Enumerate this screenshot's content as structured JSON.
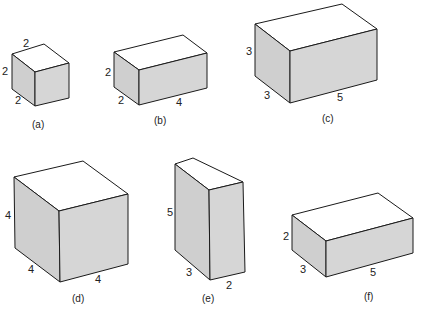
{
  "figure": {
    "boxes": [
      {
        "id": "a",
        "caption": "(a)",
        "dims": {
          "height": "2",
          "depth": "2",
          "width": "2"
        },
        "top_label": "2",
        "left_label": "2",
        "bottom_left_label": "2",
        "bottom_right_label": ""
      },
      {
        "id": "b",
        "caption": "(b)",
        "dims": {
          "height": "2",
          "depth": "2",
          "width": "4"
        },
        "top_label": "",
        "left_label": "2",
        "bottom_left_label": "2",
        "bottom_right_label": "4"
      },
      {
        "id": "c",
        "caption": "(c)",
        "dims": {
          "height": "3",
          "depth": "3",
          "width": "5"
        },
        "top_label": "",
        "left_label": "3",
        "bottom_left_label": "3",
        "bottom_right_label": "5"
      },
      {
        "id": "d",
        "caption": "(d)",
        "dims": {
          "height": "4",
          "depth": "4",
          "width": "4"
        },
        "top_label": "",
        "left_label": "4",
        "bottom_left_label": "4",
        "bottom_right_label": "4"
      },
      {
        "id": "e",
        "caption": "(e)",
        "dims": {
          "height": "5",
          "depth": "3",
          "width": "2"
        },
        "top_label": "",
        "left_label": "5",
        "bottom_left_label": "3",
        "bottom_right_label": "2"
      },
      {
        "id": "f",
        "caption": "(f)",
        "dims": {
          "height": "2",
          "depth": "3",
          "width": "5"
        },
        "top_label": "",
        "left_label": "2",
        "bottom_left_label": "3",
        "bottom_right_label": "5"
      }
    ]
  }
}
